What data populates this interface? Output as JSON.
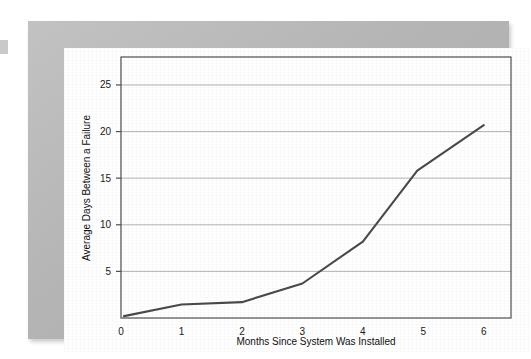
{
  "figure": {
    "background_color": "#b9b9b9",
    "card_color": "#ffffff",
    "plot_frame_color": "#555555",
    "gridline_color": "#b0b0b0",
    "series_color": "#4a4a4a"
  },
  "chart_data": {
    "type": "line",
    "title": "",
    "xlabel": "Months Since System Was Installed",
    "ylabel": "Average Days Between a Failure",
    "xlim": [
      0,
      6.45
    ],
    "ylim": [
      0,
      28
    ],
    "xticks": [
      0,
      1,
      2,
      3,
      4,
      5,
      6
    ],
    "xtick_labels": [
      "0",
      "1",
      "2",
      "3",
      "4",
      "5",
      "6"
    ],
    "yticks": [
      5,
      10,
      15,
      20,
      25
    ],
    "ytick_labels": [
      "5",
      "10",
      "15",
      "20",
      "25"
    ],
    "grid": "horizontal",
    "legend": "none",
    "series": [
      {
        "name": "Average days between a failure",
        "x": [
          0.05,
          1,
          2,
          3,
          4,
          4.9,
          6
        ],
        "values": [
          0.2,
          1.45,
          1.7,
          3.7,
          8.2,
          15.8,
          20.7
        ]
      }
    ]
  }
}
